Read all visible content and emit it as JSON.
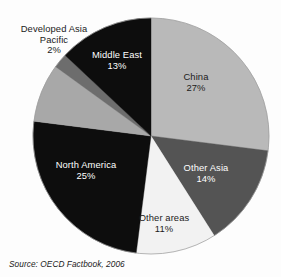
{
  "chart_data": {
    "type": "pie",
    "title": "",
    "subtitle": "",
    "xlabel": "",
    "ylabel": "",
    "legend_position": "none",
    "grid": false,
    "labels_inline": true,
    "source_note": "Source:  OECD Factbook, 2006",
    "center": {
      "cx": 151,
      "cy": 136,
      "r": 118
    },
    "start_angle_deg": 0,
    "direction": "clockwise",
    "slices": [
      {
        "name": "China",
        "label": "China",
        "value": 27,
        "value_text": "27%",
        "color": "#b9b9b9",
        "text_color": "#1b1b1b",
        "start_deg": 0,
        "end_deg": 97.2
      },
      {
        "name": "Other Asia",
        "label": "Other Asia",
        "value": 14,
        "value_text": "14%",
        "color": "#545454",
        "text_color": "#ffffff",
        "start_deg": 97.2,
        "end_deg": 147.6
      },
      {
        "name": "Other areas",
        "label": "Other areas",
        "value": 11,
        "value_text": "11%",
        "color": "#f2f2f2",
        "text_color": "#1b1b1b",
        "start_deg": 147.6,
        "end_deg": 187.2
      },
      {
        "name": "North America",
        "label": "North America",
        "value": 25,
        "value_text": "25%",
        "color": "#0d0d0d",
        "text_color": "#ffffff",
        "start_deg": 187.2,
        "end_deg": 277.2
      },
      {
        "name": "Developed Asia Pacific gray band",
        "label": "",
        "value": 8,
        "value_text": "",
        "color": "#a8a8a8",
        "text_color": "#1b1b1b",
        "start_deg": 277.2,
        "end_deg": 306.0
      },
      {
        "name": "Developed Asia Pacific",
        "label": "Developed Asia Pacific",
        "value": 2,
        "value_text": "2%",
        "color": "#6d6d6d",
        "text_color": "#1b1b1b",
        "start_deg": 306.0,
        "end_deg": 313.2
      },
      {
        "name": "Middle East",
        "label": "Middle East",
        "value": 13,
        "value_text": "13%",
        "color": "#0d0d0d",
        "text_color": "#ffffff",
        "start_deg": 313.2,
        "end_deg": 360
      }
    ],
    "categories": [
      "China",
      "Other Asia",
      "Other areas",
      "North America",
      "Developed Asia Pacific",
      "Middle East"
    ],
    "values": [
      27,
      14,
      11,
      25,
      2,
      13
    ],
    "colors": [
      "#b9b9b9",
      "#545454",
      "#f2f2f2",
      "#0d0d0d",
      "#6d6d6d",
      "#0d0d0d"
    ]
  },
  "labels": {
    "china": {
      "name": "China",
      "pct": "27%"
    },
    "other_asia": {
      "name": "Other Asia",
      "pct": "14%"
    },
    "other_areas": {
      "name": "Other areas",
      "pct": "11%"
    },
    "north_america": {
      "name": "North America",
      "pct": "25%"
    },
    "developed_asia_pacific": {
      "line1": "Developed Asia",
      "line2": "Pacific",
      "pct": "2%"
    },
    "middle_east": {
      "name": "Middle East",
      "pct": "13%"
    }
  },
  "footer": {
    "source": "Source:  OECD Factbook, 2006"
  },
  "colors": {
    "background": "#fdfdfd",
    "light_gray": "#b9b9b9",
    "mid_gray": "#a8a8a8",
    "dark_gray": "#545454",
    "sliver_gray": "#6d6d6d",
    "near_white": "#f2f2f2",
    "black": "#0d0d0d",
    "text_dark": "#1b1b1b",
    "text_light": "#ffffff"
  }
}
